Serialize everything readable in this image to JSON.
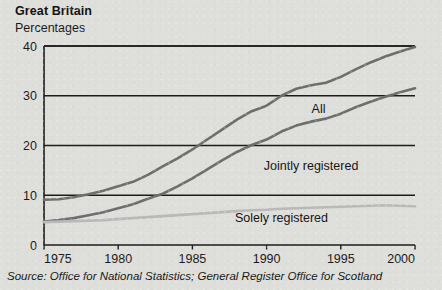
{
  "header": {
    "title": "Great Britain",
    "subtitle": "Percentages"
  },
  "footer": {
    "source": "Source: Office for National Statistics; General Register Office for Scotland"
  },
  "colors": {
    "background": "#dededa",
    "axis": "#1c1c1c",
    "grid": "#1c1c1c",
    "all_line": "#6e6e6e",
    "jointly_line": "#6e6e6e",
    "solely_line": "#b9b9b9",
    "text": "#1a1a1a"
  },
  "labels": {
    "all": "All",
    "jointly": "Jointly registered",
    "solely": "Solely registered"
  },
  "chart_data": {
    "type": "line",
    "title": "Great Britain",
    "subtitle": "Percentages",
    "xlabel": "",
    "ylabel": "Percentages",
    "xlim": [
      1975,
      2000
    ],
    "ylim": [
      0,
      40
    ],
    "yticks": [
      0,
      10,
      20,
      30,
      40
    ],
    "xticks": [
      1975,
      1980,
      1985,
      1990,
      1995,
      2000
    ],
    "grid": true,
    "legend": "inline-labels",
    "x": [
      1975,
      1976,
      1977,
      1978,
      1979,
      1980,
      1981,
      1982,
      1983,
      1984,
      1985,
      1986,
      1987,
      1988,
      1989,
      1990,
      1991,
      1992,
      1993,
      1994,
      1995,
      1996,
      1997,
      1998,
      1999,
      2000
    ],
    "series": [
      {
        "name": "All",
        "color": "#6e6e6e",
        "values": [
          9.1,
          9.2,
          9.6,
          10.2,
          10.9,
          11.8,
          12.7,
          14.1,
          15.8,
          17.4,
          19.2,
          21.2,
          23.2,
          25.2,
          26.9,
          28.0,
          30.0,
          31.4,
          32.1,
          32.6,
          33.8,
          35.3,
          36.7,
          37.9,
          38.9,
          39.8
        ]
      },
      {
        "name": "Jointly registered",
        "color": "#6e6e6e",
        "values": [
          4.7,
          5.0,
          5.4,
          6.0,
          6.6,
          7.4,
          8.2,
          9.3,
          10.3,
          11.8,
          13.4,
          15.2,
          17.0,
          18.7,
          20.1,
          21.2,
          22.8,
          24.0,
          24.8,
          25.4,
          26.4,
          27.7,
          28.8,
          29.8,
          30.7,
          31.5
        ]
      },
      {
        "name": "Solely registered",
        "color": "#b9b9b9",
        "values": [
          4.6,
          4.7,
          4.8,
          4.9,
          5.0,
          5.2,
          5.4,
          5.6,
          5.8,
          6.0,
          6.2,
          6.4,
          6.6,
          6.8,
          7.0,
          7.1,
          7.3,
          7.4,
          7.5,
          7.6,
          7.7,
          7.8,
          7.9,
          8.0,
          7.9,
          7.8
        ]
      }
    ],
    "annotations": [
      {
        "text": "All",
        "x": 1993.5,
        "y": 26.5
      },
      {
        "text": "Jointly registered",
        "x": 1993.0,
        "y": 15.0
      },
      {
        "text": "Solely registered",
        "x": 1991.0,
        "y": 4.6
      }
    ]
  }
}
